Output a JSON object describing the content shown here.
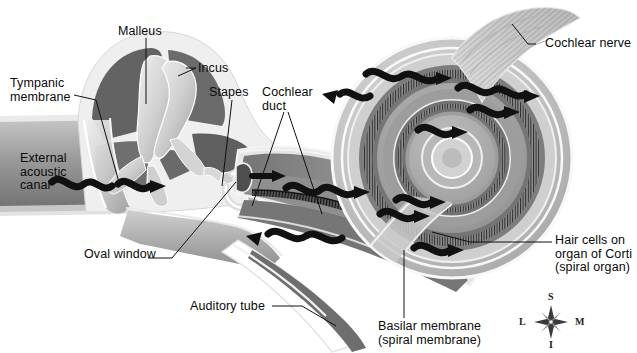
{
  "figure": {
    "background": "#ffffff",
    "width": 637,
    "height": 353
  },
  "labels": [
    {
      "id": "malleus",
      "text": "Malleus",
      "x": 118,
      "y": 25,
      "align": "left"
    },
    {
      "id": "incus",
      "text": "Incus",
      "x": 198,
      "y": 62,
      "align": "left"
    },
    {
      "id": "stapes",
      "text": "Stapes",
      "x": 209,
      "y": 86,
      "align": "left"
    },
    {
      "id": "cochlear-duct",
      "text": "Cochlear\nduct",
      "x": 262,
      "y": 86,
      "align": "left"
    },
    {
      "id": "tympanic-membrane",
      "text": "Tympanic\nmembrane",
      "x": 10,
      "y": 77,
      "align": "left"
    },
    {
      "id": "external-acoustic",
      "text": "External\nacoustic\ncanal",
      "x": 20,
      "y": 152,
      "align": "left"
    },
    {
      "id": "oval-window",
      "text": "Oval window",
      "x": 84,
      "y": 248,
      "align": "left"
    },
    {
      "id": "auditory-tube",
      "text": "Auditory tube",
      "x": 190,
      "y": 300,
      "align": "left"
    },
    {
      "id": "cochlear-nerve",
      "text": "Cochlear nerve",
      "x": 545,
      "y": 40,
      "align": "left"
    },
    {
      "id": "hair-cells",
      "text": "Hair cells on\norgan of Corti\n(spiral organ)",
      "x": 555,
      "y": 238,
      "align": "left"
    },
    {
      "id": "basilar-membrane",
      "text": "Basilar membrane\n(spiral membrane)",
      "x": 378,
      "y": 322,
      "align": "left"
    }
  ],
  "compass": {
    "center_x": 549,
    "center_y": 322,
    "superior": "S",
    "inferior": "I",
    "lateral": "L",
    "medial": "M"
  },
  "colors": {
    "ink": "#0a0a0a",
    "wave_arrow": "#111111",
    "leader_line": "#111111",
    "tissue_light": "#d8d8d8",
    "tissue_mid": "#b4b4b4",
    "tissue_dark": "#7d7d7d",
    "tissue_darkest": "#4a4a4a",
    "cavity": "#6b6b6b",
    "bone_highlight": "#eeeeee",
    "membrane": "#3a3a3a",
    "outline": "#f2f2f2"
  },
  "wave_arrows_count": 12,
  "structures": [
    "tympanic membrane",
    "malleus",
    "incus",
    "stapes",
    "oval window",
    "auditory tube",
    "external acoustic canal",
    "cochlear duct",
    "basilar membrane",
    "organ of Corti hair cells",
    "cochlear nerve",
    "cochlear spiral"
  ]
}
